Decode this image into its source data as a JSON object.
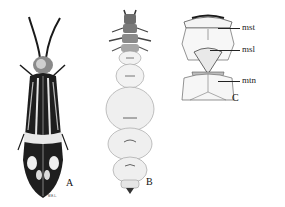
{
  "figure": {
    "panels": [
      {
        "id": "A",
        "letter": "A",
        "subject": "adult-beetle",
        "signature": "M.E.L."
      },
      {
        "id": "B",
        "letter": "B",
        "subject": "larva"
      },
      {
        "id": "C",
        "letter": "C",
        "subject": "thorax-detail",
        "labels": [
          {
            "text": "mst"
          },
          {
            "text": "msl"
          },
          {
            "text": "mtn"
          }
        ]
      }
    ],
    "colors": {
      "ink": "#1a1a1a",
      "paper": "#ffffff",
      "shade": "#d8d8d8"
    }
  }
}
